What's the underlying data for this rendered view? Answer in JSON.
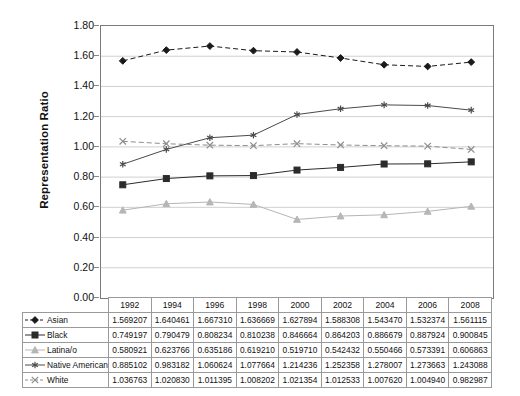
{
  "chart_data": {
    "type": "line",
    "title": "",
    "xlabel": "",
    "ylabel": "Representation Ratio",
    "categories": [
      "1992",
      "1994",
      "1996",
      "1998",
      "2000",
      "2002",
      "2004",
      "2006",
      "2008"
    ],
    "ylim": [
      0.0,
      1.8
    ],
    "ytick_labels": [
      "0.00",
      "0.20",
      "0.40",
      "0.60",
      "0.80",
      "1.00",
      "1.20",
      "1.40",
      "1.60",
      "1.80"
    ],
    "ytick_values": [
      0.0,
      0.2,
      0.4,
      0.6,
      0.8,
      1.0,
      1.2,
      1.4,
      1.6,
      1.8
    ],
    "grid": true,
    "legend_position": "data-table-left",
    "series": [
      {
        "name": "Asian",
        "marker": "diamond",
        "line_style": "dashed",
        "color": "#1a1a1a",
        "values": [
          1.569207,
          1.640461,
          1.66731,
          1.636669,
          1.627894,
          1.588308,
          1.54347,
          1.532374,
          1.561115
        ],
        "labels": [
          "1.569207",
          "1.640461",
          "1.667310",
          "1.636669",
          "1.627894",
          "1.588308",
          "1.543470",
          "1.532374",
          "1.561115"
        ]
      },
      {
        "name": "Black",
        "marker": "square",
        "line_style": "solid",
        "color": "#2b2b2b",
        "values": [
          0.749197,
          0.790479,
          0.808234,
          0.810238,
          0.846664,
          0.864203,
          0.886679,
          0.887924,
          0.900845
        ],
        "labels": [
          "0.749197",
          "0.790479",
          "0.808234",
          "0.810238",
          "0.846664",
          "0.864203",
          "0.886679",
          "0.887924",
          "0.900845"
        ]
      },
      {
        "name": "Latina/o",
        "marker": "triangle",
        "line_style": "solid",
        "color": "#b6b6b6",
        "values": [
          0.580921,
          0.623766,
          0.635186,
          0.61921,
          0.51971,
          0.542432,
          0.550466,
          0.573391,
          0.606863
        ],
        "labels": [
          "0.580921",
          "0.623766",
          "0.635186",
          "0.619210",
          "0.519710",
          "0.542432",
          "0.550466",
          "0.573391",
          "0.606863"
        ]
      },
      {
        "name": "Native American",
        "marker": "asterisk",
        "line_style": "solid",
        "color": "#4a4a4a",
        "values": [
          0.885102,
          0.983182,
          1.060624,
          1.077664,
          1.214236,
          1.252358,
          1.278007,
          1.273663,
          1.243088
        ],
        "labels": [
          "0.885102",
          "0.983182",
          "1.060624",
          "1.077664",
          "1.214236",
          "1.252358",
          "1.278007",
          "1.273663",
          "1.243088"
        ]
      },
      {
        "name": "White",
        "marker": "cross-x",
        "line_style": "dashed",
        "color": "#8d8d8d",
        "values": [
          1.036763,
          1.02083,
          1.011395,
          1.008202,
          1.021354,
          1.012533,
          1.00762,
          1.00494,
          0.982987
        ],
        "labels": [
          "1.036763",
          "1.020830",
          "1.011395",
          "1.008202",
          "1.021354",
          "1.012533",
          "1.007620",
          "1.004940",
          "0.982987"
        ]
      }
    ]
  },
  "axis": {
    "y_title": "Representation Ratio"
  },
  "table": {
    "year_headers": [
      "1992",
      "1994",
      "1996",
      "1998",
      "2000",
      "2002",
      "2004",
      "2006",
      "2008"
    ],
    "rows": [
      {
        "label": "Asian",
        "values": [
          "1.569207",
          "1.640461",
          "1.667310",
          "1.636669",
          "1.627894",
          "1.588308",
          "1.543470",
          "1.532374",
          "1.561115"
        ]
      },
      {
        "label": "Black",
        "values": [
          "0.749197",
          "0.790479",
          "0.808234",
          "0.810238",
          "0.846664",
          "0.864203",
          "0.886679",
          "0.887924",
          "0.900845"
        ]
      },
      {
        "label": "Latina/o",
        "values": [
          "0.580921",
          "0.623766",
          "0.635186",
          "0.619210",
          "0.519710",
          "0.542432",
          "0.550466",
          "0.573391",
          "0.606863"
        ]
      },
      {
        "label": "Native American",
        "values": [
          "0.885102",
          "0.983182",
          "1.060624",
          "1.077664",
          "1.214236",
          "1.252358",
          "1.278007",
          "1.273663",
          "1.243088"
        ]
      },
      {
        "label": "White",
        "values": [
          "1.036763",
          "1.020830",
          "1.011395",
          "1.008202",
          "1.021354",
          "1.012533",
          "1.007620",
          "1.004940",
          "0.982987"
        ]
      }
    ]
  },
  "colors": {
    "grid": "#d0d0d0",
    "axis": "#7a7a7a",
    "table_border": "#9a9a9a"
  }
}
